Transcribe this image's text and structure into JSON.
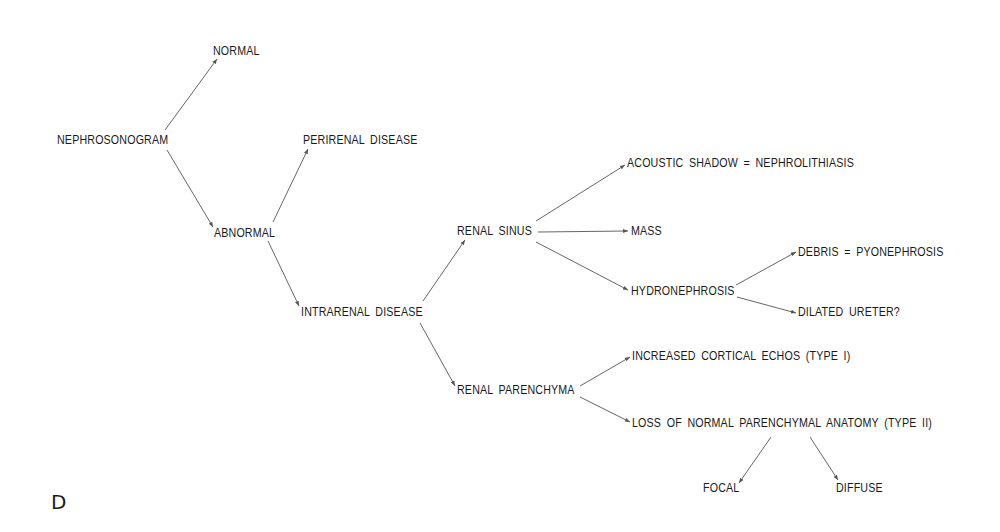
{
  "panel_label": "D",
  "nodes": {
    "nephrosonogram": "NEPHROSONOGRAM",
    "normal": "NORMAL",
    "abnormal": "ABNORMAL",
    "perirenal_disease": "PERIRENAL  DISEASE",
    "intrarenal_disease": "INTRARENAL  DISEASE",
    "renal_sinus": "RENAL  SINUS",
    "renal_parenchyma": "RENAL  PARENCHYMA",
    "acoustic_shadow": "ACOUSTIC  SHADOW  =  NEPHROLITHIASIS",
    "mass": "MASS",
    "hydronephrosis": "HYDRONEPHROSIS",
    "debris": "DEBRIS  =  PYONEPHROSIS",
    "dilated_ureter": "DILATED  URETER?",
    "increased_cortical": "INCREASED  CORTICAL  ECHOS  (TYPE  I)",
    "loss_of_normal": "LOSS  OF  NORMAL  PARENCHYMAL  ANATOMY  (TYPE  II)",
    "focal": "FOCAL",
    "diffuse": "DIFFUSE"
  },
  "edges": [
    {
      "from": "nephrosonogram",
      "to": "normal"
    },
    {
      "from": "nephrosonogram",
      "to": "abnormal"
    },
    {
      "from": "abnormal",
      "to": "perirenal_disease"
    },
    {
      "from": "abnormal",
      "to": "intrarenal_disease"
    },
    {
      "from": "intrarenal_disease",
      "to": "renal_sinus"
    },
    {
      "from": "intrarenal_disease",
      "to": "renal_parenchyma"
    },
    {
      "from": "renal_sinus",
      "to": "acoustic_shadow"
    },
    {
      "from": "renal_sinus",
      "to": "mass"
    },
    {
      "from": "renal_sinus",
      "to": "hydronephrosis"
    },
    {
      "from": "hydronephrosis",
      "to": "debris"
    },
    {
      "from": "hydronephrosis",
      "to": "dilated_ureter"
    },
    {
      "from": "renal_parenchyma",
      "to": "increased_cortical"
    },
    {
      "from": "renal_parenchyma",
      "to": "loss_of_normal"
    },
    {
      "from": "loss_of_normal",
      "to": "focal"
    },
    {
      "from": "loss_of_normal",
      "to": "diffuse"
    }
  ],
  "colors": {
    "text": "#1a1a1a",
    "edge": "#555555",
    "background": "#ffffff"
  }
}
